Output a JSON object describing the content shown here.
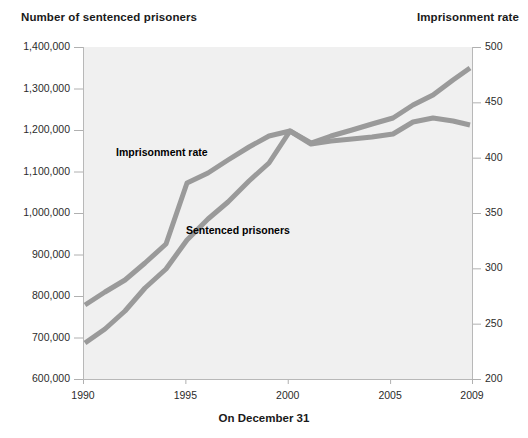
{
  "header": {
    "left_axis_title": "Number of sentenced prisoners",
    "right_axis_title": "Imprisonment rate"
  },
  "chart_data": {
    "type": "line",
    "title": "",
    "xlabel": "On December 31",
    "ylabel": "Number of sentenced prisoners",
    "y2label": "Imprisonment rate",
    "grid": false,
    "legend_position": "inline-annotations",
    "xlim": [
      1990,
      2009
    ],
    "ylim": [
      600000,
      1400000
    ],
    "y2lim": [
      200,
      500
    ],
    "xticks": [
      1990,
      1995,
      2000,
      2005,
      2009
    ],
    "xtick_labels": [
      "1990",
      "1995",
      "2000",
      "2005",
      "2009"
    ],
    "yticks": [
      600000,
      700000,
      800000,
      900000,
      1000000,
      1100000,
      1200000,
      1300000,
      1400000
    ],
    "ytick_labels": [
      "600,000",
      "700,000",
      "800,000",
      "900,000",
      "1,000,000",
      "1,100,000",
      "1,200,000",
      "1,300,000",
      "1,400,000"
    ],
    "y2ticks": [
      200,
      250,
      300,
      350,
      400,
      450,
      500
    ],
    "y2tick_labels": [
      "200",
      "250",
      "300",
      "350",
      "400",
      "450",
      "500"
    ],
    "x": [
      1990,
      1991,
      1992,
      1993,
      1994,
      1995,
      1996,
      1997,
      1998,
      1999,
      2000,
      2001,
      2002,
      2003,
      2004,
      2005,
      2006,
      2007,
      2008,
      2009
    ],
    "series": [
      {
        "name": "Sentenced prisoners",
        "axis": "left",
        "color": "#9a9a9a",
        "annotation": "Sentenced prisoners",
        "values": [
          689000,
          728000,
          780000,
          846000,
          904000,
          989000,
          1049000,
          1100000,
          1161000,
          1213000,
          1245000,
          1259000,
          1277000,
          1296000,
          1316000,
          1338000,
          1377000,
          1396000,
          1409000,
          1405000
        ]
      },
      {
        "name": "Imprisonment rate",
        "axis": "right",
        "color": "#9a9a9a",
        "annotation": "Imprisonment rate",
        "values": [
          292,
          313,
          332,
          359,
          389,
          411,
          427,
          444,
          461,
          476,
          478,
          470,
          476,
          482,
          486,
          491,
          501,
          506,
          504,
          502
        ]
      }
    ],
    "series_pixel_paths": {
      "sentenced_prisoners": [
        [
          85,
          343
        ],
        [
          105,
          329
        ],
        [
          125,
          311
        ],
        [
          145,
          288
        ],
        [
          166,
          269
        ],
        [
          187,
          240
        ],
        [
          208,
          219
        ],
        [
          228,
          202
        ],
        [
          249,
          181
        ],
        [
          269,
          163
        ],
        [
          290,
          131
        ],
        [
          311,
          143
        ],
        [
          331,
          136
        ],
        [
          352,
          130
        ],
        [
          372,
          124
        ],
        [
          393,
          118
        ],
        [
          413,
          105
        ],
        [
          433,
          95
        ],
        [
          453,
          80
        ],
        [
          470,
          68
        ]
      ],
      "imprisonment_rate": [
        [
          85,
          305
        ],
        [
          105,
          292
        ],
        [
          125,
          280
        ],
        [
          145,
          263
        ],
        [
          166,
          244
        ],
        [
          187,
          183
        ],
        [
          208,
          173
        ],
        [
          228,
          160
        ],
        [
          249,
          147
        ],
        [
          269,
          136
        ],
        [
          290,
          131
        ],
        [
          311,
          144
        ],
        [
          331,
          141
        ],
        [
          352,
          139
        ],
        [
          372,
          137
        ],
        [
          393,
          134
        ],
        [
          413,
          122
        ],
        [
          433,
          118
        ],
        [
          453,
          121
        ],
        [
          470,
          125
        ]
      ]
    },
    "annotations": [
      {
        "text": "Imprisonment rate",
        "x_px": 116,
        "y_px": 146
      },
      {
        "text": "Sentenced prisoners",
        "x_px": 186,
        "y_px": 224
      }
    ],
    "plot_area_px": {
      "left": 83,
      "right": 472,
      "top": 47,
      "bottom": 379
    },
    "plot_background": "#f0f0f0",
    "axis_color": "#aaaaaa",
    "line_color": "#9a9a9a",
    "line_width_px": 5
  }
}
